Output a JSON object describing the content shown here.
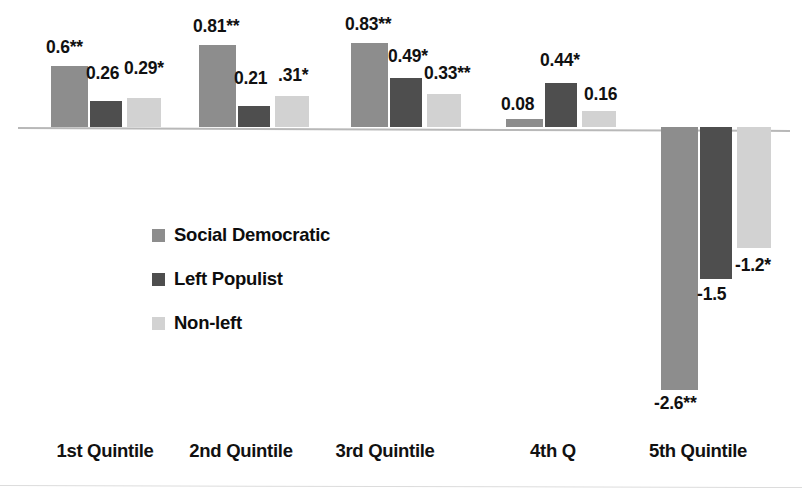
{
  "chart_data": {
    "type": "bar",
    "title": "",
    "subtitle": "",
    "xlabel": "",
    "ylabel": "",
    "orientation": "vertical",
    "grid": false,
    "zero_line": true,
    "legend_position": "inside-left",
    "ylim": [
      -2.9,
      1.0
    ],
    "categories": [
      "1st Quintile",
      "2nd Quintile",
      "3rd Quintile",
      "4th Q",
      "5th Quintile"
    ],
    "series": [
      {
        "name": "Social Democratic",
        "color": "#8d8d8d",
        "values": [
          0.6,
          0.81,
          0.83,
          0.08,
          -2.6
        ],
        "labels": [
          "0.6**",
          "0.81**",
          "0.83**",
          "0.08",
          "-2.6**"
        ],
        "significance": [
          "**",
          "**",
          "**",
          "",
          "**"
        ]
      },
      {
        "name": "Left Populist",
        "color": "#4e4e4e",
        "values": [
          0.26,
          0.21,
          0.49,
          0.44,
          -1.5
        ],
        "labels": [
          "0.26",
          "0.21",
          "0.49*",
          "0.44*",
          "-1.5"
        ],
        "significance": [
          "",
          "",
          "*",
          "*",
          ""
        ]
      },
      {
        "name": "Non-left",
        "color": "#d2d2d2",
        "values": [
          0.29,
          0.31,
          0.33,
          0.16,
          -1.2
        ],
        "labels": [
          "0.29*",
          ".31*",
          "0.33**",
          "0.16",
          "-1.2*"
        ],
        "significance": [
          "*",
          "*",
          "**",
          "",
          "*"
        ]
      }
    ]
  },
  "legend": {
    "items": [
      {
        "label": "Social Democratic",
        "swatch": "sd"
      },
      {
        "label": "Left Populist",
        "swatch": "lp"
      },
      {
        "label": "Non-left",
        "swatch": "nl"
      }
    ]
  },
  "axis": {
    "categories": [
      {
        "label": "1st Quintile",
        "x": 105
      },
      {
        "label": "2nd Quintile",
        "x": 241
      },
      {
        "label": "3rd Quintile",
        "x": 385
      },
      {
        "label": "4th Q",
        "x": 553
      },
      {
        "label": "5th Quintile",
        "x": 698
      }
    ]
  },
  "bars": [
    {
      "name": "bar-q1-social-democratic",
      "cls": "sd",
      "x": 51,
      "w": 37,
      "value": 0.6,
      "label": "0.6**",
      "lx": 46,
      "ly": 37
    },
    {
      "name": "bar-q1-left-populist",
      "cls": "lp",
      "x": 90,
      "w": 32,
      "value": 0.26,
      "label": "0.26",
      "lx": 86,
      "ly": 63
    },
    {
      "name": "bar-q1-non-left",
      "cls": "nl",
      "x": 127,
      "w": 34,
      "value": 0.29,
      "label": "0.29*",
      "lx": 124,
      "ly": 58
    },
    {
      "name": "bar-q2-social-democratic",
      "cls": "sd",
      "x": 199,
      "w": 37,
      "value": 0.81,
      "label": "0.81**",
      "lx": 193,
      "ly": 16
    },
    {
      "name": "bar-q2-left-populist",
      "cls": "lp",
      "x": 238,
      "w": 32,
      "value": 0.21,
      "label": "0.21",
      "lx": 234,
      "ly": 68
    },
    {
      "name": "bar-q2-non-left",
      "cls": "nl",
      "x": 275,
      "w": 34,
      "value": 0.31,
      "label": ".31*",
      "lx": 278,
      "ly": 65
    },
    {
      "name": "bar-q3-social-democratic",
      "cls": "sd",
      "x": 351,
      "w": 37,
      "value": 0.83,
      "label": "0.83**",
      "lx": 345,
      "ly": 14
    },
    {
      "name": "bar-q3-left-populist",
      "cls": "lp",
      "x": 390,
      "w": 32,
      "value": 0.49,
      "label": "0.49*",
      "lx": 388,
      "ly": 46
    },
    {
      "name": "bar-q3-non-left",
      "cls": "nl",
      "x": 427,
      "w": 34,
      "value": 0.33,
      "label": "0.33**",
      "lx": 424,
      "ly": 63
    },
    {
      "name": "bar-q4-social-democratic",
      "cls": "sd",
      "x": 506,
      "w": 37,
      "value": 0.08,
      "label": "0.08",
      "lx": 501,
      "ly": 94
    },
    {
      "name": "bar-q4-left-populist",
      "cls": "lp",
      "x": 545,
      "w": 32,
      "value": 0.44,
      "label": "0.44*",
      "lx": 540,
      "ly": 50
    },
    {
      "name": "bar-q4-non-left",
      "cls": "nl",
      "x": 582,
      "w": 34,
      "value": 0.16,
      "label": "0.16",
      "lx": 584,
      "ly": 84
    },
    {
      "name": "bar-q5-social-democratic",
      "cls": "sd",
      "x": 661,
      "w": 37,
      "value": -2.6,
      "label": "-2.6**",
      "lx": 654,
      "ly": 393
    },
    {
      "name": "bar-q5-left-populist",
      "cls": "lp",
      "x": 700,
      "w": 32,
      "value": -1.5,
      "label": "-1.5",
      "lx": 697,
      "ly": 284
    },
    {
      "name": "bar-q5-non-left",
      "cls": "nl",
      "x": 737,
      "w": 34,
      "value": -1.2,
      "label": "-1.2*",
      "lx": 735,
      "ly": 255
    }
  ]
}
